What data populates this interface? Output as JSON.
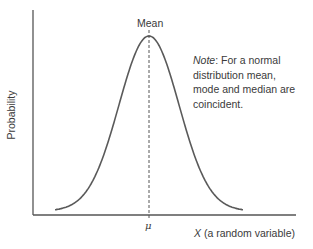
{
  "chart_data": {
    "type": "line",
    "title": "",
    "xlabel": "X (a random variable)",
    "xlabel_var": "X",
    "xlabel_rest": " (a random variable)",
    "ylabel": "Probability",
    "x_tick_labels": [
      "μ"
    ],
    "grid": false,
    "legend": null,
    "series": [
      {
        "name": "Normal distribution (bell curve)",
        "description": "Symmetric bell-shaped probability density centered at the mean μ",
        "x": [
          -3,
          -2.5,
          -2,
          -1.5,
          -1,
          -0.5,
          0,
          0.5,
          1,
          1.5,
          2,
          2.5,
          3
        ],
        "values": [
          0.011,
          0.044,
          0.135,
          0.325,
          0.607,
          0.882,
          1.0,
          0.882,
          0.607,
          0.325,
          0.135,
          0.044,
          0.011
        ]
      }
    ],
    "annotations": [
      {
        "type": "vertical-dashed-line",
        "x": 0,
        "label": "Mean"
      },
      {
        "type": "text",
        "text": "Note: For a normal distribution mean, mode and median are coincident."
      }
    ]
  },
  "labels": {
    "mean": "Mean",
    "mu": "μ",
    "ylabel": "Probability",
    "xlabel_var": "X",
    "xlabel_rest": " (a random variable)",
    "note_prefix": "Note",
    "note_text": ": For a normal distribution mean, mode and median are coincident."
  },
  "colors": {
    "axis": "#555555",
    "curve": "#5a5a5a",
    "text": "#3a3a3a"
  }
}
